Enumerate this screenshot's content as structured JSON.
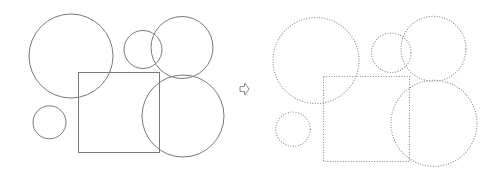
{
  "diagram": {
    "colors": {
      "background": "#ffffff",
      "solid_stroke": "#7a7a7a",
      "dotted_stroke": "#8a8a8a",
      "arrow_stroke": "#8a8a8a",
      "arrow_fill": "#ffffff"
    },
    "before": {
      "style": "solid",
      "circles": [
        {
          "cx": 71,
          "cy": 56,
          "r": 42
        },
        {
          "cx": 143,
          "cy": 49.5,
          "r": 19
        },
        {
          "cx": 182,
          "cy": 47.5,
          "r": 31
        },
        {
          "cx": 183,
          "cy": 116,
          "r": 41
        },
        {
          "cx": 49.5,
          "cy": 122.3,
          "r": 16.5
        }
      ],
      "rect": {
        "x": 78.5,
        "y": 72.5,
        "width": 81,
        "height": 80
      }
    },
    "arrow": {
      "icon": "outlined-right-arrow",
      "x": 240,
      "y": 83,
      "width": 9,
      "height": 12
    },
    "after": {
      "style": "dotted",
      "circles": [
        {
          "cx": 316,
          "cy": 60.5,
          "r": 43
        },
        {
          "cx": 391.3,
          "cy": 52.8,
          "r": 19.7
        },
        {
          "cx": 433.5,
          "cy": 48.8,
          "r": 32.5
        },
        {
          "cx": 434,
          "cy": 123.3,
          "r": 43
        },
        {
          "cx": 293,
          "cy": 129.2,
          "r": 17.2
        }
      ],
      "rect": {
        "x": 323.5,
        "y": 76.5,
        "width": 86,
        "height": 85
      }
    }
  }
}
